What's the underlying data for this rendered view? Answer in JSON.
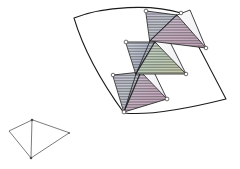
{
  "figure": {
    "background_color": "#ffffff",
    "canvas": {
      "width": 240,
      "height": 169
    },
    "stroke_colors": {
      "patch_outline": "#1a1a1a",
      "triangle_edge": "#222222",
      "kite_edge": "#5a5a5a",
      "vertex_marker_fill": "#ffffff",
      "vertex_marker_stroke": "#333333"
    },
    "hatch": {
      "orientation": "horizontal",
      "spacing_px": 1.6,
      "line_width_px": 0.55,
      "line_color": "#3b3b3b",
      "description": "fine horizontal hatch lines filling each triangular face"
    },
    "fill_tints": {
      "lavender": "#bfb4d6",
      "pale_green": "#c6d8c2",
      "pink": "#d8b6c8",
      "steel_blue": "#aeb7cd",
      "pale_yellow": "#d9d7b2",
      "white": "#f6f6f6"
    }
  },
  "patch": {
    "name": "curved-quadrilateral-patch",
    "corners": [
      {
        "label": "top-left",
        "x": 74,
        "y": 18
      },
      {
        "label": "top-right",
        "x": 181,
        "y": 13
      },
      {
        "label": "bottom-right",
        "x": 226,
        "y": 99
      },
      {
        "label": "bottom-left",
        "x": 124,
        "y": 113
      }
    ],
    "edges": [
      {
        "name": "top-edge",
        "type": "curve",
        "bulge": "outward-up"
      },
      {
        "name": "right-edge",
        "type": "line"
      },
      {
        "name": "bottom-edge",
        "type": "curve",
        "bulge": "outward-down"
      },
      {
        "name": "left-edge",
        "type": "curve",
        "bulge": "outward-left"
      }
    ]
  },
  "strips": [
    {
      "name": "upper-strip",
      "apex": {
        "x": 146,
        "y": 11
      },
      "mid_upper": {
        "x": 177,
        "y": 15
      },
      "center": {
        "x": 150,
        "y": 41
      },
      "right_tip": {
        "x": 206,
        "y": 48
      },
      "tints": [
        "lavender",
        "pale_green",
        "pink"
      ]
    },
    {
      "name": "middle-strip",
      "apex": {
        "x": 126,
        "y": 42
      },
      "mid_upper": {
        "x": 155,
        "y": 42
      },
      "center": {
        "x": 136,
        "y": 74
      },
      "right_tip": {
        "x": 186,
        "y": 74
      },
      "tints": [
        "steel_blue",
        "pale_green",
        "pale_yellow"
      ]
    },
    {
      "name": "lower-strip",
      "apex": {
        "x": 113,
        "y": 75
      },
      "mid_upper": {
        "x": 141,
        "y": 72
      },
      "center": {
        "x": 124,
        "y": 112
      },
      "right_tip": {
        "x": 167,
        "y": 99
      },
      "tints": [
        "lavender",
        "pink",
        "pale_green"
      ]
    }
  ],
  "kite": {
    "name": "reference-kite",
    "vertices": [
      {
        "label": "top",
        "x": 32,
        "y": 120
      },
      {
        "label": "left",
        "x": 9,
        "y": 131
      },
      {
        "label": "bottom",
        "x": 31,
        "y": 158
      },
      {
        "label": "right",
        "x": 69,
        "y": 133
      }
    ],
    "diagonal": {
      "from": "top",
      "to": "bottom"
    }
  }
}
